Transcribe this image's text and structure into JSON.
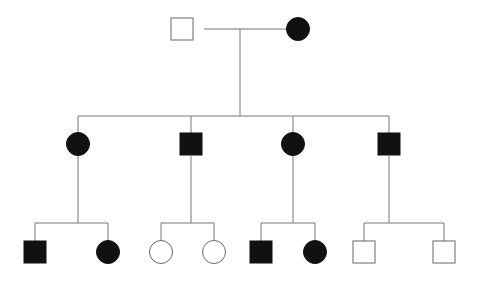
{
  "diagram": {
    "type": "pedigree",
    "colors": {
      "affected": "#111111",
      "unaffected": "#ffffff",
      "stroke": "#666666",
      "line": "#777777"
    },
    "lines": [
      {
        "id": "g1-couple",
        "x1": 204,
        "y1": 29,
        "x2": 286,
        "y2": 29
      },
      {
        "id": "g1-descent",
        "x1": 240,
        "y1": 29,
        "x2": 240,
        "y2": 116
      },
      {
        "id": "g2-sibship",
        "x1": 78,
        "y1": 116,
        "x2": 389,
        "y2": 116
      },
      {
        "id": "g2-drop-1",
        "x1": 78,
        "y1": 116,
        "x2": 78,
        "y2": 133
      },
      {
        "id": "g2-drop-2",
        "x1": 191,
        "y1": 116,
        "x2": 191,
        "y2": 133
      },
      {
        "id": "g2-drop-3",
        "x1": 293,
        "y1": 116,
        "x2": 293,
        "y2": 133
      },
      {
        "id": "g2-drop-4",
        "x1": 389,
        "y1": 116,
        "x2": 389,
        "y2": 133
      },
      {
        "id": "g2-1-descent",
        "x1": 78,
        "y1": 156,
        "x2": 78,
        "y2": 223
      },
      {
        "id": "g2-2-descent",
        "x1": 191,
        "y1": 156,
        "x2": 191,
        "y2": 223
      },
      {
        "id": "g2-3-descent",
        "x1": 293,
        "y1": 156,
        "x2": 293,
        "y2": 223
      },
      {
        "id": "g2-4-descent",
        "x1": 389,
        "y1": 156,
        "x2": 389,
        "y2": 223
      },
      {
        "id": "g3-sib-a",
        "x1": 35,
        "y1": 223,
        "x2": 108,
        "y2": 223
      },
      {
        "id": "g3-sib-a-l",
        "x1": 35,
        "y1": 223,
        "x2": 35,
        "y2": 241
      },
      {
        "id": "g3-sib-a-r",
        "x1": 108,
        "y1": 223,
        "x2": 108,
        "y2": 241
      },
      {
        "id": "g3-sib-b",
        "x1": 161,
        "y1": 223,
        "x2": 214,
        "y2": 223
      },
      {
        "id": "g3-sib-b-l",
        "x1": 161,
        "y1": 223,
        "x2": 161,
        "y2": 241
      },
      {
        "id": "g3-sib-b-r",
        "x1": 214,
        "y1": 223,
        "x2": 214,
        "y2": 241
      },
      {
        "id": "g3-sib-c",
        "x1": 261,
        "y1": 223,
        "x2": 315,
        "y2": 223
      },
      {
        "id": "g3-sib-c-l",
        "x1": 261,
        "y1": 223,
        "x2": 261,
        "y2": 241
      },
      {
        "id": "g3-sib-c-r",
        "x1": 315,
        "y1": 223,
        "x2": 315,
        "y2": 241
      },
      {
        "id": "g3-sib-d",
        "x1": 364,
        "y1": 223,
        "x2": 444,
        "y2": 223
      },
      {
        "id": "g3-sib-d-l",
        "x1": 364,
        "y1": 223,
        "x2": 364,
        "y2": 241
      },
      {
        "id": "g3-sib-d-r",
        "x1": 444,
        "y1": 223,
        "x2": 444,
        "y2": 241
      }
    ],
    "individuals": [
      {
        "id": "I-1",
        "generation": 1,
        "sex": "male",
        "affected": false,
        "x": 182,
        "y": 29
      },
      {
        "id": "I-2",
        "generation": 1,
        "sex": "female",
        "affected": true,
        "x": 298,
        "y": 29
      },
      {
        "id": "II-1",
        "generation": 2,
        "sex": "female",
        "affected": true,
        "x": 78,
        "y": 144
      },
      {
        "id": "II-2",
        "generation": 2,
        "sex": "male",
        "affected": true,
        "x": 191,
        "y": 144
      },
      {
        "id": "II-3",
        "generation": 2,
        "sex": "female",
        "affected": true,
        "x": 293,
        "y": 144
      },
      {
        "id": "II-4",
        "generation": 2,
        "sex": "male",
        "affected": true,
        "x": 389,
        "y": 144
      },
      {
        "id": "III-1",
        "generation": 3,
        "sex": "male",
        "affected": true,
        "x": 35,
        "y": 252
      },
      {
        "id": "III-2",
        "generation": 3,
        "sex": "female",
        "affected": true,
        "x": 108,
        "y": 252
      },
      {
        "id": "III-3",
        "generation": 3,
        "sex": "female",
        "affected": false,
        "x": 161,
        "y": 252
      },
      {
        "id": "III-4",
        "generation": 3,
        "sex": "female",
        "affected": false,
        "x": 214,
        "y": 252
      },
      {
        "id": "III-5",
        "generation": 3,
        "sex": "male",
        "affected": true,
        "x": 261,
        "y": 252
      },
      {
        "id": "III-6",
        "generation": 3,
        "sex": "female",
        "affected": true,
        "x": 315,
        "y": 252
      },
      {
        "id": "III-7",
        "generation": 3,
        "sex": "male",
        "affected": false,
        "x": 364,
        "y": 252
      },
      {
        "id": "III-8",
        "generation": 3,
        "sex": "male",
        "affected": false,
        "x": 444,
        "y": 252
      }
    ]
  }
}
